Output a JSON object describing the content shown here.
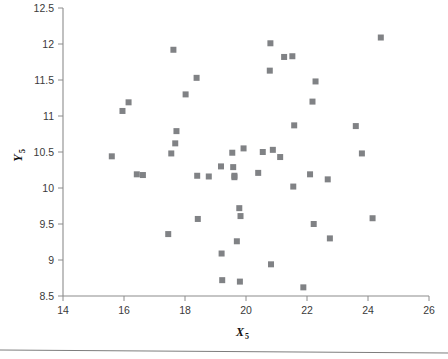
{
  "figure": {
    "background_color": "#ffffff",
    "marker_color": "#808285",
    "axis_color": "#8c8c8c",
    "tick_label_color": "#3a3a3a",
    "footer_rule_color": "#7d7d7d"
  },
  "chart_data": {
    "type": "scatter",
    "title": "",
    "xlabel": "X",
    "xlabel_subscript": "5",
    "ylabel": "Y",
    "ylabel_subscript": "5",
    "xlim": [
      14,
      26
    ],
    "ylim": [
      8.5,
      12.5
    ],
    "xticks": [
      14,
      16,
      18,
      20,
      22,
      24,
      26
    ],
    "xtick_labels": [
      "14",
      "16",
      "18",
      "20",
      "22",
      "24",
      "26"
    ],
    "yticks": [
      8.5,
      9,
      9.5,
      10,
      10.5,
      11,
      11.5,
      12,
      12.5
    ],
    "ytick_labels": [
      "8.5",
      "9",
      "9.5",
      "10",
      "10.5",
      "11",
      "11.5",
      "12",
      "12.5"
    ],
    "grid": false,
    "legend": false,
    "marker_shape": "square",
    "marker_size": 6,
    "n_points": 49,
    "points": [
      {
        "x": 15.6,
        "y": 10.44
      },
      {
        "x": 15.95,
        "y": 11.07
      },
      {
        "x": 16.15,
        "y": 11.19
      },
      {
        "x": 16.42,
        "y": 10.19
      },
      {
        "x": 16.62,
        "y": 10.18
      },
      {
        "x": 17.45,
        "y": 9.36
      },
      {
        "x": 17.55,
        "y": 10.48
      },
      {
        "x": 17.62,
        "y": 11.92
      },
      {
        "x": 17.68,
        "y": 10.62
      },
      {
        "x": 17.72,
        "y": 10.79
      },
      {
        "x": 18.02,
        "y": 11.3
      },
      {
        "x": 18.38,
        "y": 11.53
      },
      {
        "x": 18.4,
        "y": 10.17
      },
      {
        "x": 18.42,
        "y": 9.57
      },
      {
        "x": 18.78,
        "y": 10.16
      },
      {
        "x": 19.18,
        "y": 10.3
      },
      {
        "x": 19.2,
        "y": 9.09
      },
      {
        "x": 19.22,
        "y": 8.72
      },
      {
        "x": 19.55,
        "y": 10.49
      },
      {
        "x": 19.58,
        "y": 10.29
      },
      {
        "x": 19.62,
        "y": 10.17
      },
      {
        "x": 19.62,
        "y": 10.15
      },
      {
        "x": 19.7,
        "y": 9.26
      },
      {
        "x": 19.78,
        "y": 9.72
      },
      {
        "x": 19.8,
        "y": 8.7
      },
      {
        "x": 19.82,
        "y": 9.61
      },
      {
        "x": 19.92,
        "y": 10.55
      },
      {
        "x": 20.4,
        "y": 10.21
      },
      {
        "x": 20.55,
        "y": 10.5
      },
      {
        "x": 20.78,
        "y": 11.63
      },
      {
        "x": 20.8,
        "y": 12.01
      },
      {
        "x": 20.82,
        "y": 8.94
      },
      {
        "x": 20.88,
        "y": 10.53
      },
      {
        "x": 21.12,
        "y": 10.43
      },
      {
        "x": 21.25,
        "y": 11.82
      },
      {
        "x": 21.52,
        "y": 11.83
      },
      {
        "x": 21.55,
        "y": 10.02
      },
      {
        "x": 21.58,
        "y": 10.87
      },
      {
        "x": 21.88,
        "y": 8.62
      },
      {
        "x": 22.1,
        "y": 10.19
      },
      {
        "x": 22.18,
        "y": 11.2
      },
      {
        "x": 22.22,
        "y": 9.5
      },
      {
        "x": 22.28,
        "y": 11.48
      },
      {
        "x": 22.68,
        "y": 10.12
      },
      {
        "x": 22.75,
        "y": 9.3
      },
      {
        "x": 23.6,
        "y": 10.86
      },
      {
        "x": 23.8,
        "y": 10.48
      },
      {
        "x": 24.15,
        "y": 9.58
      },
      {
        "x": 24.42,
        "y": 12.09
      }
    ]
  }
}
